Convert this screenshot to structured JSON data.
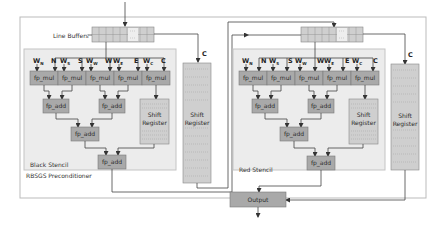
{
  "title": "RBSGS Preconditioner",
  "line_buffers_label": "Line Buffers",
  "colors": {
    "outer_bg": "#ffffff",
    "outer_border": "#bbbbbb",
    "stencil_bg": "#ececec",
    "stencil_border": "#c4c4c4",
    "op_fill": "#a9a9a9",
    "op_border": "#7a7a7a",
    "buffer_fill": "#cfcfcf",
    "line": "#444444"
  },
  "stencils": [
    {
      "name": "Black Stencil",
      "weights": [
        {
          "w": "W",
          "sub": "N",
          "dir": "N"
        },
        {
          "w": "W",
          "sub": "S",
          "dir": "S"
        },
        {
          "w": "W",
          "sub": "W",
          "dir": "W"
        },
        {
          "w": "W",
          "sub": "E",
          "dir": "E"
        },
        {
          "w": "W",
          "sub": "C",
          "dir": "C"
        }
      ],
      "mul_label": "fp_mul",
      "add_label": "fp_add",
      "shift_register_label": [
        "Shift",
        "Register"
      ]
    },
    {
      "name": "Red Stencil",
      "weights": [
        {
          "w": "W",
          "sub": "N",
          "dir": "N"
        },
        {
          "w": "W",
          "sub": "S",
          "dir": "S"
        },
        {
          "w": "W",
          "sub": "W",
          "dir": "W"
        },
        {
          "w": "W",
          "sub": "E",
          "dir": "E"
        },
        {
          "w": "W",
          "sub": "C",
          "dir": "C"
        }
      ],
      "mul_label": "fp_mul",
      "add_label": "fp_add",
      "shift_register_label": [
        "Shift",
        "Register"
      ]
    }
  ],
  "side_shift_register_label": [
    "Shift",
    "Register"
  ],
  "c_label": "C",
  "output_label": "Output"
}
